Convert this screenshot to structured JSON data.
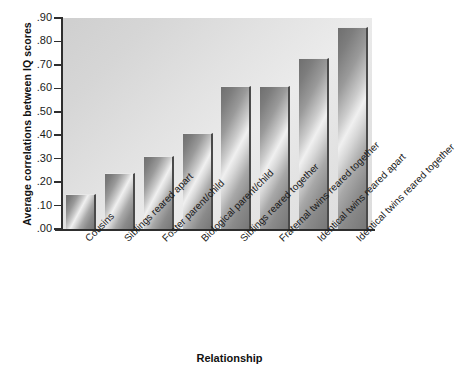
{
  "chart_data": {
    "type": "bar",
    "title": "",
    "xlabel": "Relationship",
    "ylabel": "Average correlations between IQ scores",
    "ylim": [
      0.0,
      0.9
    ],
    "grid": false,
    "legend": "none",
    "categories": [
      "Cousins",
      "Siblings reared apart",
      "Foster parent/child",
      "Biological parent/child",
      "Siblings reared together",
      "Fraternal twins reared together",
      "Identical twins reared apart",
      "Identical twins reared together"
    ],
    "values": [
      0.15,
      0.24,
      0.31,
      0.41,
      0.61,
      0.61,
      0.73,
      0.86
    ],
    "ytick_labels": [
      ".90",
      ".80",
      ".70",
      ".60",
      ".50",
      ".40",
      ".30",
      ".20",
      ".10",
      ".00"
    ],
    "ytick_values": [
      0.9,
      0.8,
      0.7,
      0.6,
      0.5,
      0.4,
      0.3,
      0.2,
      0.1,
      0.0
    ]
  },
  "axes": {
    "y_title": "Average correlations between IQ scores",
    "x_title": "Relationship"
  },
  "colors": {
    "plot_background": "#e4e4e4",
    "bar_light": "#f0f0f0",
    "bar_dark": "#6f6f6f",
    "axis": "#2e2e2e",
    "text": "#1a1a1a"
  }
}
